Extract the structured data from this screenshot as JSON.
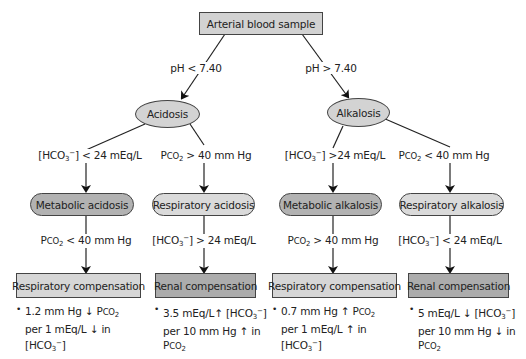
{
  "root": {
    "label": "Arterial blood sample"
  },
  "branches": {
    "left": {
      "condition": "pH < 7.40",
      "node": "Acidosis"
    },
    "right": {
      "condition": "pH > 7.40",
      "node": "Alkalosis"
    }
  },
  "level2_conditions": [
    {
      "pre": "[HCO",
      "sub": "3",
      "sup": "−",
      "post": "] < 24 mEq/L"
    },
    {
      "pre": "P",
      "sc": "CO",
      "sub": "2",
      "post": " > 40 mm Hg"
    },
    {
      "pre": "[HCO",
      "sub": "3",
      "sup": "−",
      "post": "] >24 mEq/L"
    },
    {
      "pre": "P",
      "sc": "CO",
      "sub": "2",
      "post": " < 40 mm Hg"
    }
  ],
  "disorders": [
    {
      "label": "Metabolic acidosis",
      "shade": "dark"
    },
    {
      "label": "Respiratory acidosis",
      "shade": "light"
    },
    {
      "label": "Metabolic alkalosis",
      "shade": "dark"
    },
    {
      "label": "Respiratory alkalosis",
      "shade": "light"
    }
  ],
  "level3_conditions": [
    {
      "pre": "P",
      "sc": "CO",
      "sub": "2",
      "post": " < 40 mm Hg"
    },
    {
      "pre": "[HCO",
      "sub": "3",
      "sup": "−",
      "post": "] > 24 mEq/L"
    },
    {
      "pre": "P",
      "sc": "CO",
      "sub": "2",
      "post": " > 40 mm Hg"
    },
    {
      "pre": "[HCO",
      "sub": "3",
      "sup": "−",
      "post": "] < 24 mEq/L"
    }
  ],
  "compensations": [
    {
      "label": "Respiratory compensation",
      "shade": "light"
    },
    {
      "label": "Renal compensation",
      "shade": "dark"
    },
    {
      "label": "Respiratory compensation",
      "shade": "light"
    },
    {
      "label": "Renal compensation",
      "shade": "dark"
    }
  ],
  "notes": [
    {
      "bullet": "•",
      "l1a": "1.2 mm Hg ",
      "l1arrow": "↓",
      "l1b": " P",
      "l1sc": "CO",
      "l1sub": "2",
      "l2a": "per 1 mEq/L ",
      "l2arrow": "↓",
      "l2b": " in",
      "l3": "[HCO",
      "l3sub": "3",
      "l3sup": "−",
      "l3end": "]"
    },
    {
      "bullet": "•",
      "l1a": "3.5 mEq/L",
      "l1arrow": "↑",
      "l1b": " [HCO",
      "l1sub": "3",
      "l1sup": "−",
      "l1end": "]",
      "l2a": "per 10 mm Hg ",
      "l2arrow": "↑",
      "l2b": " in",
      "l3": "P",
      "l3sc": "CO",
      "l3sub": "2"
    },
    {
      "bullet": "•",
      "l1a": "0.7 mm Hg ",
      "l1arrow": "↑",
      "l1b": " P",
      "l1sc": "CO",
      "l1sub": "2",
      "l2a": "per 1 mEq/L ",
      "l2arrow": "↑",
      "l2b": " in",
      "l3": "[HCO",
      "l3sub": "3",
      "l3sup": "−",
      "l3end": "]"
    },
    {
      "bullet": "•",
      "l1a": "5 mEq/L ",
      "l1arrow": "↓",
      "l1b": " [HCO",
      "l1sub": "3",
      "l1sup": "−",
      "l1end": "]",
      "l2a": "per 10 mm Hg ",
      "l2arrow": "↓",
      "l2b": " in",
      "l3": "P",
      "l3sc": "CO",
      "l3sub": "2"
    }
  ]
}
